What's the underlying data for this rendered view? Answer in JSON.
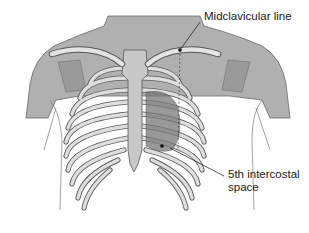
{
  "figure": {
    "colors": {
      "skin": "#a9a9a9",
      "bone": "#d9d9d9",
      "bone_outline": "#6a6a6a",
      "heart": "#7a7a7a",
      "background": "#ffffff"
    }
  },
  "labels": {
    "midclavicular": "Midclavicular line",
    "intercostal_line1": "5th intercostal",
    "intercostal_line2": "space"
  }
}
